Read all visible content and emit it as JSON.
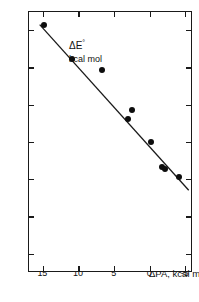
{
  "figure": {
    "background_color": "#ffffff",
    "ink_color": "#111111"
  },
  "axes": {
    "y": {
      "title_symbol": "ΔE",
      "title_superscript": "°",
      "title_unit": "kcal mol",
      "ticks": [
        -15,
        -10,
        -5,
        0,
        5,
        10,
        15
      ],
      "tick_labels": [
        "-15",
        "-10",
        "-5",
        "0",
        "5",
        "10",
        "15"
      ],
      "range": [
        -17.5,
        17.5
      ],
      "inverted": true
    },
    "x": {
      "title_main": "ΔPA, kcal mol",
      "title_superscript": "-1",
      "ticks": [
        15,
        10,
        5,
        0,
        -5
      ],
      "tick_labels": [
        "15",
        "10",
        "5",
        "0",
        "-5"
      ],
      "range": [
        17.0,
        -6.0
      ],
      "inverted": true
    }
  },
  "chart_data": {
    "type": "scatter",
    "title": "",
    "xlabel": "ΔPA, kcal mol⁻¹",
    "ylabel": "ΔE°, kcal mol",
    "xlim": [
      17.0,
      -6.0
    ],
    "ylim": [
      17.5,
      -17.5
    ],
    "grid": false,
    "legend": null,
    "marker": "filled-circle",
    "marker_color": "#0d0d0d",
    "points": [
      {
        "x": 14.9,
        "y": 15.8
      },
      {
        "x": 11.0,
        "y": 11.2
      },
      {
        "x": 6.8,
        "y": 9.7
      },
      {
        "x": 3.1,
        "y": 3.2
      },
      {
        "x": 2.5,
        "y": 4.3
      },
      {
        "x": -0.1,
        "y": 0.1
      },
      {
        "x": -1.7,
        "y": -3.3
      },
      {
        "x": -2.1,
        "y": -3.5
      },
      {
        "x": -4.0,
        "y": -4.6
      }
    ],
    "fit_line": {
      "type": "linear-regression",
      "x_start": 15.5,
      "y_start": 15.8,
      "x_end": -5.4,
      "y_end": -6.4,
      "color": "#1a1a1a"
    }
  }
}
